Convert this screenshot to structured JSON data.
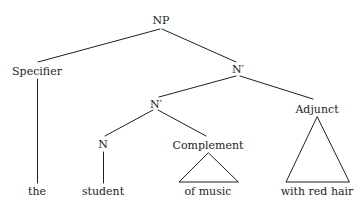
{
  "figure": {
    "kind": "syntax-tree",
    "background_color": "#ffffff",
    "line_color": "#231f20",
    "text_color": "#231f20"
  },
  "nodes": {
    "root": "NP",
    "specifier": "Specifier",
    "nbar_upper": "N′",
    "nbar_lower": "N′",
    "head": "N",
    "complement": "Complement",
    "adjunct": "Adjunct"
  },
  "terminals": {
    "determiner": "the",
    "noun": "student",
    "complement_phrase": "of music",
    "adjunct_phrase": "with red hair"
  }
}
